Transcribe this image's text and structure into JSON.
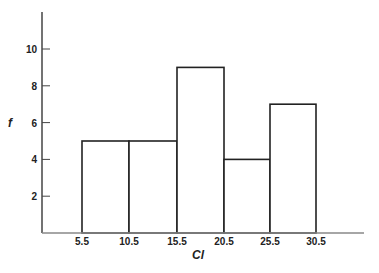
{
  "chart_data": {
    "type": "bar",
    "subtype": "histogram",
    "title": "",
    "xlabel": "Cl",
    "ylabel": "f",
    "bin_edges": [
      5.5,
      10.5,
      15.5,
      20.5,
      25.5,
      30.5
    ],
    "categories": [
      "5.5-10.5",
      "10.5-15.5",
      "15.5-20.5",
      "20.5-25.5",
      "25.5-30.5"
    ],
    "values": [
      5,
      5,
      9,
      4,
      7
    ],
    "x_tick_labels": [
      "5.5",
      "10.5",
      "15.5",
      "20.5",
      "25.5",
      "30.5"
    ],
    "y_tick_labels": [
      "2",
      "4",
      "6",
      "8",
      "10"
    ],
    "y_ticks": [
      2,
      4,
      6,
      8,
      10
    ],
    "ylim": [
      0,
      12
    ],
    "grid": false,
    "legend": null,
    "colors": {
      "bar_fill": "#ffffff",
      "bar_stroke": "#222222",
      "axis": "#444444"
    }
  }
}
